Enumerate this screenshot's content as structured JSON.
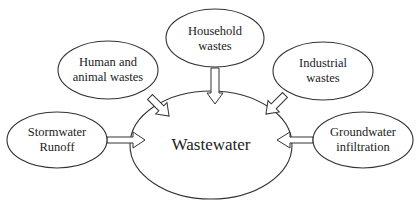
{
  "diagram": {
    "center": {
      "label": "Wastewater"
    },
    "sources": [
      {
        "id": "household",
        "line1": "Household",
        "line2": "wastes"
      },
      {
        "id": "human-animal",
        "line1": "Human and",
        "line2": "animal wastes"
      },
      {
        "id": "industrial",
        "line1": "Industrial",
        "line2": "wastes"
      },
      {
        "id": "stormwater",
        "line1": "Stormwater",
        "line2": "Runoff"
      },
      {
        "id": "groundwater",
        "line1": "Groundwater",
        "line2": "infiltration"
      }
    ],
    "colors": {
      "stroke": "#333333",
      "background": "#ffffff",
      "text": "#222222"
    }
  }
}
